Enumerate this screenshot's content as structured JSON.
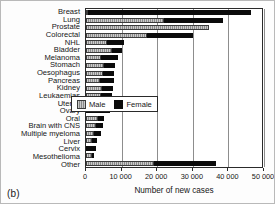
{
  "panel_label": "(b)",
  "legend": {
    "position": "inside-lower-right",
    "entries": [
      {
        "label": "Male",
        "color": "#8a8a8a"
      },
      {
        "label": "Female",
        "color": "#0b0b0b"
      }
    ]
  },
  "chart_data": {
    "type": "bar",
    "orientation": "horizontal",
    "stacked": true,
    "title": "",
    "subtitle": "",
    "xlabel": "Number of new cases",
    "ylabel": "",
    "xlim": [
      0,
      50000
    ],
    "xticks": [
      0,
      10000,
      20000,
      30000,
      40000,
      50000
    ],
    "xticklabels": [
      "0",
      "10 000",
      "20 000",
      "30 000",
      "40 000",
      "50 000"
    ],
    "grid": true,
    "grid_axis": "x",
    "legend_position": "inside-lower-right",
    "categories": [
      "Breast",
      "Lung",
      "Prostate",
      "Colorectal",
      "NHL",
      "Bladder",
      "Melanoma",
      "Stomach",
      "Oesophagus",
      "Pancreas",
      "Kidney",
      "Leukaemias",
      "Uterus",
      "Ovary",
      "Oral",
      "Brain with CNS",
      "Multiple myeloma",
      "Liver",
      "Cervix",
      "Mesothelioma",
      "Other"
    ],
    "series": [
      {
        "name": "Male",
        "color": "#8a8a8a",
        "values": [
          300,
          22000,
          34500,
          17000,
          5800,
          7400,
          4200,
          5000,
          4800,
          3900,
          4600,
          4200,
          0,
          0,
          3300,
          2800,
          2300,
          1800,
          0,
          1800,
          19000
        ]
      },
      {
        "name": "Female",
        "color": "#0b0b0b",
        "values": [
          45700,
          16500,
          0,
          13000,
          4800,
          2600,
          4800,
          3100,
          3100,
          4000,
          2900,
          3200,
          7000,
          6800,
          1900,
          2000,
          1800,
          1300,
          2800,
          400,
          17500
        ]
      }
    ],
    "totals": [
      46000,
      38500,
      34500,
      30000,
      10600,
      10000,
      9000,
      8100,
      7900,
      7900,
      7500,
      7400,
      7000,
      6800,
      5200,
      4800,
      4100,
      3100,
      2800,
      2200,
      36500
    ]
  }
}
